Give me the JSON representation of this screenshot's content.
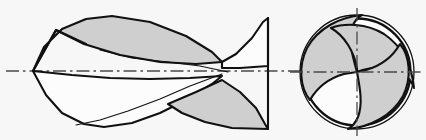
{
  "figure": {
    "projection": "two-view orthographic",
    "background_color": "#f7f7f7",
    "line_color": "#111111",
    "shade_color": "#cfcfcf",
    "face_color": "#fcfcfc",
    "centerline_color": "#4a4a4a",
    "caption": "",
    "labels": [],
    "dimensions": [],
    "annotations": []
  },
  "views": {
    "side": {
      "name": "side-elevation",
      "label": "",
      "axis_y": 71,
      "tip_x": 33,
      "shank_x": 268,
      "top_y": 16,
      "bottom_y": 129,
      "flute_count": 2,
      "helix_turns": 0.55
    },
    "end": {
      "name": "end-view",
      "label": "",
      "center_x": 357,
      "center_y": 72,
      "outer_radius": 57,
      "inner_radius": 53,
      "flute_count": 3,
      "web_shape": "spiral"
    }
  },
  "geometry": {
    "side_upper_gray": "M 33 71 L 44 47 L 62 29 L 86 19 L 112 16 L 150 22 L 186 36 L 212 52 L 222 62 L 196 64 L 160 62 L 120 55 L 84 44 L 56 30 Z",
    "side_upper_white": "M 222 62 L 236 54 L 252 38 L 263 22 L 268 18 L 268 66 L 240 68 L 222 68 Z",
    "side_lower_white": "M 33 71 L 46 95 L 62 113 L 84 124 L 104 127 L 132 123 L 160 113 L 188 99 L 212 84 L 222 76 L 190 78 L 150 79 L 110 78 L 72 75 Z",
    "side_lower_gray": "M 222 80 L 240 92 L 256 108 L 265 124 L 268 129 L 232 128 L 205 122 L 182 113 L 168 104 L 196 92 Z",
    "side_tip_seam": "M 33 71 L 56 30",
    "side_tip_seam2": "M 56 30 L 86 44",
    "side_flank_a": "M 84 44 L 96 124",
    "side_flank_b": "M 112 16 L 104 127",
    "side_helix_thin1": "M 222 74 L 190 86 L 160 99 L 128 111 L 100 120 L 76 125",
    "side_helix_thin2": "M 228 72 L 200 66 L 168 62 L 132 58 L 100 50",
    "side_shank_edge": "M 268 18 L 268 129",
    "end_flute_1": "M 357 72 C 352 54 348 40 352 27 C 356 18 360 16 362 15 C 340 17 318 28 307 48 C 298 66 300 88 310 100 C 318 86 330 78 344 74 Z",
    "end_flute_2": "M 357 72 C 372 66 388 66 400 72 C 410 78 413 84 414 88 C 412 66 402 46 384 34 C 366 23 344 23 331 28 C 345 36 354 52 357 68 Z",
    "end_flute_3": "M 357 72 C 360 88 363 104 358 117 C 354 126 350 128 348 129 C 370 127 392 116 403 96 C 412 78 410 56 400 44 C 392 58 380 66 366 70 Z",
    "end_center_dot": "M 357 72"
  },
  "centerlines": {
    "side_horizontal": {
      "x1": 6,
      "y1": 71,
      "x2": 300,
      "y2": 71
    },
    "end_horizontal": {
      "x1": 290,
      "y1": 72,
      "x2": 424,
      "y2": 72
    },
    "end_vertical": {
      "x1": 357,
      "y1": 8,
      "x2": 357,
      "y2": 136
    }
  }
}
